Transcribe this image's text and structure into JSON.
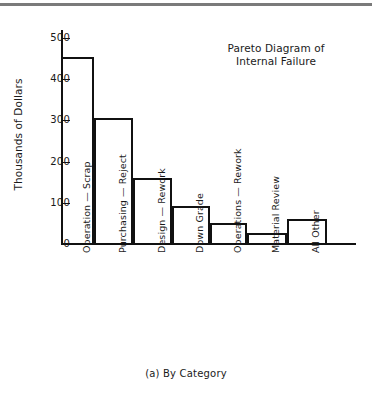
{
  "figure": {
    "caption": "(a)  By Category",
    "top_rule_color": "#7a7a7a",
    "line_color": "#111111",
    "background": "#ffffff"
  },
  "chart_data": {
    "type": "bar",
    "title": "Pareto Diagram of\nInternal Failure",
    "title_line1": "Pareto Diagram of",
    "title_line2": "Internal Failure",
    "xlabel": "",
    "ylabel": "Thousands of Dollars",
    "ylim": [
      0,
      520
    ],
    "yticks": [
      0,
      100,
      200,
      300,
      400,
      500
    ],
    "ytick_labels": [
      "0",
      "100",
      "200",
      "300",
      "400",
      "500"
    ],
    "grid": false,
    "legend": null,
    "categories": [
      "Operation — Scrap",
      "Purchasing — Reject",
      "Design — Rework",
      "Down Grade",
      "Operations — Rework",
      "Material Review",
      "All Other"
    ],
    "values": [
      455,
      305,
      160,
      93,
      50,
      27,
      60
    ],
    "bar_style": "outline",
    "bar_fill": "none",
    "bar_edge_color": "#111111"
  }
}
